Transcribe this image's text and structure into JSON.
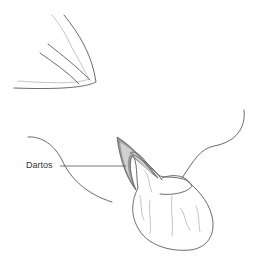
{
  "figure": {
    "labels": [
      {
        "text": "Dartos",
        "target": "dartos-layer"
      }
    ],
    "colors": {
      "outline": "#6b6b6b",
      "detail": "#b5b5b5",
      "dartos_fill": "#9a9a9a",
      "dartos_light": "#d0d0d0",
      "label_text": "#333333"
    }
  }
}
